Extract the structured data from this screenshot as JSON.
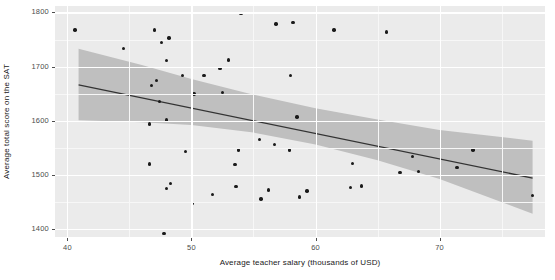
{
  "chart_data": {
    "type": "scatter",
    "title": "",
    "subtitle": "",
    "xlabel": "Average teacher salary (thousands of USD)",
    "ylabel": "Average total score on the SAT",
    "xlim": [
      39.0,
      78.5
    ],
    "ylim": [
      1385,
      1812
    ],
    "xticks": [
      40,
      50,
      60,
      70
    ],
    "yticks": [
      1400,
      1500,
      1600,
      1700,
      1800
    ],
    "xtick_labels": [
      "40",
      "50",
      "60",
      "70"
    ],
    "ytick_labels": [
      "1400",
      "1500",
      "1600",
      "1700",
      "1800"
    ],
    "grid": true,
    "legend": "none",
    "point_color": "#1a1a1a",
    "line_color": "#333333",
    "ribbon_color": "#bfbfbf",
    "panel_color": "#ebebeb",
    "gridline_color": "#ffffff",
    "points": [
      {
        "x": 40.6,
        "y": 1768
      },
      {
        "x": 44.5,
        "y": 1733
      },
      {
        "x": 47.0,
        "y": 1768
      },
      {
        "x": 47.6,
        "y": 1745
      },
      {
        "x": 48.2,
        "y": 1753
      },
      {
        "x": 48.0,
        "y": 1711
      },
      {
        "x": 49.3,
        "y": 1684
      },
      {
        "x": 47.2,
        "y": 1674
      },
      {
        "x": 46.8,
        "y": 1665
      },
      {
        "x": 51.0,
        "y": 1684
      },
      {
        "x": 53.0,
        "y": 1712
      },
      {
        "x": 52.3,
        "y": 1697
      },
      {
        "x": 54.0,
        "y": 1798
      },
      {
        "x": 56.8,
        "y": 1779
      },
      {
        "x": 58.2,
        "y": 1781
      },
      {
        "x": 61.5,
        "y": 1768
      },
      {
        "x": 65.7,
        "y": 1764
      },
      {
        "x": 50.2,
        "y": 1649
      },
      {
        "x": 52.5,
        "y": 1652
      },
      {
        "x": 47.4,
        "y": 1636
      },
      {
        "x": 48.0,
        "y": 1601
      },
      {
        "x": 46.6,
        "y": 1594
      },
      {
        "x": 58.0,
        "y": 1684
      },
      {
        "x": 58.5,
        "y": 1607
      },
      {
        "x": 55.5,
        "y": 1565
      },
      {
        "x": 53.8,
        "y": 1546
      },
      {
        "x": 49.5,
        "y": 1543
      },
      {
        "x": 56.7,
        "y": 1556
      },
      {
        "x": 57.9,
        "y": 1546
      },
      {
        "x": 46.6,
        "y": 1520
      },
      {
        "x": 53.5,
        "y": 1519
      },
      {
        "x": 63.0,
        "y": 1521
      },
      {
        "x": 67.8,
        "y": 1534
      },
      {
        "x": 72.7,
        "y": 1546
      },
      {
        "x": 66.8,
        "y": 1504
      },
      {
        "x": 68.3,
        "y": 1506
      },
      {
        "x": 71.4,
        "y": 1513
      },
      {
        "x": 48.3,
        "y": 1484
      },
      {
        "x": 48.0,
        "y": 1475
      },
      {
        "x": 53.6,
        "y": 1478
      },
      {
        "x": 56.2,
        "y": 1472
      },
      {
        "x": 62.8,
        "y": 1477
      },
      {
        "x": 63.7,
        "y": 1479
      },
      {
        "x": 59.3,
        "y": 1470
      },
      {
        "x": 51.7,
        "y": 1464
      },
      {
        "x": 50.1,
        "y": 1447
      },
      {
        "x": 55.6,
        "y": 1455
      },
      {
        "x": 58.7,
        "y": 1459
      },
      {
        "x": 77.5,
        "y": 1462
      },
      {
        "x": 47.8,
        "y": 1391
      }
    ],
    "fit_line": {
      "x_start": 40.9,
      "y_start": 1666,
      "x_end": 77.5,
      "y_end": 1494
    },
    "confidence_band": {
      "x": [
        40.9,
        46.0,
        50.0,
        55.0,
        60.0,
        65.0,
        70.0,
        77.5
      ],
      "upper": [
        1733,
        1703,
        1677,
        1648,
        1623,
        1602,
        1583,
        1563
      ],
      "lower": [
        1601,
        1597,
        1592,
        1578,
        1556,
        1527,
        1492,
        1428
      ]
    }
  }
}
